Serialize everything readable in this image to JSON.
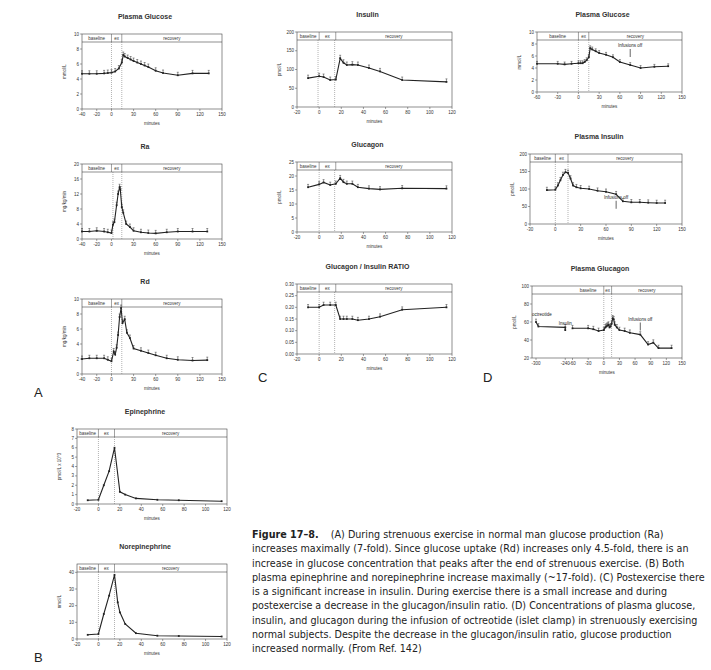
{
  "figure": {
    "caption_label": "Figure 17–8.",
    "caption_text": "(A) During strenuous exercise in normal man glucose production (Ra) increases maximally (7-fold). Since glucose uptake (Rd) increases only 4.5-fold, there is an increase in glucose concentration that peaks after the end of strenuous exercise. (B) Both plasma epinephrine and norepinephrine increase maximally (~17-fold). (C) Postexercise there is a significant increase in insulin. During exercise there is a small increase and during postexercise a decrease in the glucagon/insulin ratio. (D) Concentrations of plasma glucose, insulin, and glucagon during the infusion of octreotide (islet clamp) in strenuously exercising normal subjects. Despite the decrease in the glucagon/insulin ratio, glucose production increased normally. (From Ref. 142)",
    "panel_letters": {
      "A": "A",
      "B": "B",
      "C": "C",
      "D": "D"
    }
  },
  "chart_data": [
    {
      "id": "A1",
      "panel": "A",
      "type": "line",
      "title": "Plasma Glucose",
      "xlabel": "minutes",
      "ylabel": "mmol/L",
      "xlim": [
        -40,
        150
      ],
      "ylim": [
        0,
        10
      ],
      "xticks": [
        -40,
        -20,
        0,
        50,
        60,
        90,
        120,
        150
      ],
      "xtick_labels": [
        "-40",
        "-20",
        "0",
        "30",
        "60",
        "90",
        "120",
        "150"
      ],
      "xticks_pos": [
        -40,
        -20,
        0,
        30,
        60,
        90,
        120,
        150
      ],
      "yticks": [
        0,
        2,
        4,
        6,
        8,
        10
      ],
      "phases": [
        {
          "label": "baseline",
          "x0": -40,
          "x1": 0
        },
        {
          "label": "ex",
          "x0": 0,
          "x1": 14
        },
        {
          "label": "recovery",
          "x0": 14,
          "x1": 150
        }
      ],
      "vlines": [
        0,
        14
      ],
      "x": [
        -40,
        -30,
        -20,
        -10,
        -5,
        0,
        5,
        10,
        14,
        16,
        18,
        22,
        26,
        30,
        35,
        40,
        45,
        50,
        60,
        70,
        90,
        110,
        132
      ],
      "y": [
        4.7,
        4.7,
        4.7,
        4.75,
        4.8,
        4.85,
        5.0,
        5.4,
        6.2,
        7.2,
        7.0,
        6.8,
        6.6,
        6.4,
        6.2,
        6.0,
        5.8,
        5.6,
        5.1,
        4.8,
        4.5,
        4.75,
        4.75
      ],
      "error_bars": true
    },
    {
      "id": "A2",
      "panel": "A",
      "type": "line",
      "title": "Ra",
      "xlabel": "minutes",
      "ylabel": "mg/kg/min",
      "xlim": [
        -40,
        150
      ],
      "ylim": [
        0,
        20
      ],
      "xticks_pos": [
        -40,
        -20,
        0,
        30,
        60,
        90,
        120,
        150
      ],
      "xtick_labels": [
        "-40",
        "-20",
        "0",
        "30",
        "60",
        "90",
        "120",
        "150"
      ],
      "yticks": [
        0,
        4,
        8,
        12,
        16,
        20
      ],
      "phases": [
        {
          "label": "baseline",
          "x0": -40,
          "x1": 0
        },
        {
          "label": "ex",
          "x0": 0,
          "x1": 14
        },
        {
          "label": "recovery",
          "x0": 14,
          "x1": 150
        }
      ],
      "vlines": [
        2,
        14
      ],
      "x": [
        -40,
        -30,
        -20,
        -10,
        -5,
        0,
        2,
        4,
        7,
        9,
        11,
        12,
        14,
        16,
        20,
        25,
        30,
        40,
        50,
        60,
        75,
        90,
        110,
        130
      ],
      "y": [
        2.0,
        2.0,
        2.2,
        2.0,
        1.8,
        1.6,
        3.8,
        4.5,
        9.0,
        12.0,
        13.8,
        13.2,
        8.5,
        7.0,
        4.0,
        3.2,
        2.2,
        1.8,
        1.6,
        1.5,
        1.8,
        2.0,
        2.0,
        2.0
      ],
      "error_bars": true
    },
    {
      "id": "A3",
      "panel": "A",
      "type": "line",
      "title": "Rd",
      "xlabel": "minutes",
      "ylabel": "mg/kg/min",
      "xlim": [
        -40,
        150
      ],
      "ylim": [
        0,
        10
      ],
      "xticks_pos": [
        -40,
        -20,
        0,
        30,
        60,
        90,
        120,
        150
      ],
      "xtick_labels": [
        "-40",
        "-20",
        "0",
        "30",
        "60",
        "90",
        "120",
        "150"
      ],
      "yticks": [
        0,
        2,
        4,
        6,
        8,
        10
      ],
      "phases": [
        {
          "label": "baseline",
          "x0": -40,
          "x1": 0
        },
        {
          "label": "ex",
          "x0": 0,
          "x1": 14
        },
        {
          "label": "recovery",
          "x0": 14,
          "x1": 150
        }
      ],
      "vlines": [
        0,
        14
      ],
      "x": [
        -40,
        -30,
        -20,
        -10,
        -5,
        0,
        3,
        5,
        7,
        9,
        11,
        13,
        15,
        18,
        21,
        25,
        30,
        40,
        50,
        60,
        75,
        90,
        110,
        130
      ],
      "y": [
        2.0,
        2.1,
        2.1,
        2.1,
        1.9,
        1.7,
        3.0,
        2.6,
        3.5,
        5.2,
        7.6,
        8.8,
        6.8,
        7.3,
        5.5,
        4.8,
        3.4,
        3.1,
        2.8,
        2.5,
        2.1,
        1.9,
        1.8,
        1.85
      ],
      "error_bars": true
    },
    {
      "id": "B1",
      "panel": "B",
      "type": "line",
      "title": "Epinephrine",
      "xlabel": "minutes",
      "ylabel": "pmol/L x 10^3",
      "xlim": [
        -20,
        120
      ],
      "ylim": [
        0,
        8
      ],
      "xticks_pos": [
        -20,
        0,
        20,
        40,
        60,
        80,
        100,
        120
      ],
      "xtick_labels": [
        "-20",
        "0",
        "20",
        "40",
        "60",
        "80",
        "100",
        "120"
      ],
      "yticks": [
        0,
        1,
        2,
        3,
        4,
        5,
        6,
        7,
        8
      ],
      "phases": [
        {
          "label": "baseline",
          "x0": -20,
          "x1": 0
        },
        {
          "label": "ex",
          "x0": 0,
          "x1": 15
        },
        {
          "label": "recovery",
          "x0": 15,
          "x1": 120
        }
      ],
      "vlines": [
        0,
        15
      ],
      "x": [
        -10,
        0,
        5,
        10,
        15,
        20,
        25,
        35,
        55,
        75,
        115
      ],
      "y": [
        0.4,
        0.45,
        2.0,
        3.5,
        6.0,
        1.3,
        1.0,
        0.6,
        0.45,
        0.4,
        0.3
      ],
      "error_bars": false
    },
    {
      "id": "B2",
      "panel": "B",
      "type": "line",
      "title": "Norepinephrine",
      "xlabel": "minutes",
      "ylabel": "nmol/L",
      "xlim": [
        -20,
        120
      ],
      "ylim": [
        0,
        45
      ],
      "xticks_pos": [
        -20,
        0,
        20,
        40,
        60,
        80,
        100,
        120
      ],
      "xtick_labels": [
        "-20",
        "0",
        "20",
        "40",
        "60",
        "80",
        "100",
        "120"
      ],
      "yticks": [
        0,
        10,
        20,
        30,
        40
      ],
      "phases": [
        {
          "label": "baseline",
          "x0": -20,
          "x1": 0
        },
        {
          "label": "ex",
          "x0": 0,
          "x1": 15
        },
        {
          "label": "recovery",
          "x0": 15,
          "x1": 120
        }
      ],
      "vlines": [
        0,
        15
      ],
      "x": [
        -10,
        0,
        5,
        10,
        15,
        18,
        20,
        25,
        35,
        55,
        75,
        115
      ],
      "y": [
        2.5,
        3.0,
        15.0,
        26.0,
        38.5,
        22.0,
        16.0,
        9.0,
        3.5,
        2.0,
        1.8,
        1.5
      ],
      "error_bars": false
    },
    {
      "id": "C1",
      "panel": "C",
      "type": "line",
      "title": "Insulin",
      "xlabel": "minutes",
      "ylabel": "pmol/L",
      "xlim": [
        -20,
        120
      ],
      "ylim": [
        0,
        200
      ],
      "xticks_pos": [
        -20,
        0,
        20,
        40,
        60,
        80,
        100,
        120
      ],
      "xtick_labels": [
        "-20",
        "0",
        "20",
        "40",
        "60",
        "80",
        "100",
        "120"
      ],
      "yticks": [
        0,
        50,
        100,
        150,
        200
      ],
      "phases": [
        {
          "label": "baseline",
          "x0": -20,
          "x1": 0
        },
        {
          "label": "ex",
          "x0": 0,
          "x1": 15
        },
        {
          "label": "recovery",
          "x0": 15,
          "x1": 120
        }
      ],
      "vlines": [
        -1,
        14
      ],
      "x": [
        -10,
        0,
        4,
        10,
        15,
        19,
        22,
        25,
        30,
        35,
        45,
        55,
        75,
        115
      ],
      "y": [
        77,
        82,
        80,
        72,
        73,
        130,
        118,
        112,
        113,
        112,
        104,
        95,
        72,
        67
      ],
      "error_bars": true
    },
    {
      "id": "C2",
      "panel": "C",
      "type": "line",
      "title": "Glucagon",
      "xlabel": "minutes",
      "ylabel": "pmol/L",
      "xlim": [
        -20,
        120
      ],
      "ylim": [
        0,
        25
      ],
      "xticks_pos": [
        -20,
        0,
        20,
        40,
        60,
        80,
        100,
        120
      ],
      "xtick_labels": [
        "-20",
        "0",
        "20",
        "40",
        "60",
        "80",
        "100",
        "120"
      ],
      "yticks": [
        0,
        5,
        10,
        15,
        20,
        25
      ],
      "phases": [
        {
          "label": "baseline",
          "x0": -20,
          "x1": 0
        },
        {
          "label": "ex",
          "x0": 0,
          "x1": 15
        },
        {
          "label": "recovery",
          "x0": 15,
          "x1": 120
        }
      ],
      "vlines": [
        0,
        14
      ],
      "x": [
        -10,
        0,
        4,
        10,
        15,
        19,
        22,
        25,
        30,
        35,
        45,
        55,
        75,
        115
      ],
      "y": [
        16,
        17,
        17.7,
        16.8,
        17.2,
        19.2,
        17.8,
        17.2,
        17.2,
        16.0,
        15.5,
        15.2,
        15.6,
        15.5
      ],
      "error_bars": true
    },
    {
      "id": "C3",
      "panel": "C",
      "type": "line",
      "title": "Glucagon / Insulin RATIO",
      "xlabel": "minutes",
      "ylabel": "",
      "xlim": [
        -20,
        120
      ],
      "ylim": [
        0,
        0.3
      ],
      "xticks_pos": [
        -20,
        0,
        20,
        40,
        60,
        80,
        100,
        120
      ],
      "xtick_labels": [
        "-20",
        "0",
        "20",
        "40",
        "60",
        "80",
        "100",
        "120"
      ],
      "yticks": [
        0,
        0.05,
        0.1,
        0.15,
        0.2,
        0.25,
        0.3
      ],
      "ytick_labels": [
        "0.00",
        "0.05",
        "0.10",
        "0.15",
        "0.20",
        "0.25",
        "0.30"
      ],
      "phases": [
        {
          "label": "baseline",
          "x0": -20,
          "x1": 0
        },
        {
          "label": "ex",
          "x0": 0,
          "x1": 15
        },
        {
          "label": "recovery",
          "x0": 15,
          "x1": 120
        }
      ],
      "vlines": [
        0,
        14
      ],
      "x": [
        -10,
        0,
        4,
        10,
        15,
        19,
        22,
        25,
        30,
        35,
        45,
        55,
        75,
        115
      ],
      "y": [
        0.2,
        0.2,
        0.21,
        0.21,
        0.21,
        0.15,
        0.15,
        0.15,
        0.15,
        0.145,
        0.15,
        0.16,
        0.19,
        0.2
      ],
      "error_bars": true
    },
    {
      "id": "D1",
      "panel": "D",
      "type": "line",
      "title": "Plasma Glucose",
      "xlabel": "minutes",
      "ylabel": "mmol/L",
      "xlim": [
        -60,
        150
      ],
      "ylim": [
        0,
        10
      ],
      "xticks_pos": [
        -60,
        -30,
        0,
        30,
        60,
        90,
        120,
        150
      ],
      "xtick_labels": [
        "-60",
        "-30",
        "0",
        "30",
        "60",
        "90",
        "120",
        "150"
      ],
      "yticks": [
        0,
        2,
        4,
        6,
        8,
        10
      ],
      "phases": [
        {
          "label": "baseline",
          "x0": -60,
          "x1": 0
        },
        {
          "label": "ex",
          "x0": 0,
          "x1": 15
        },
        {
          "label": "recovery",
          "x0": 15,
          "x1": 150
        }
      ],
      "vlines": [
        0,
        15
      ],
      "x": [
        -60,
        -30,
        -20,
        -10,
        0,
        3,
        6,
        9,
        12,
        15,
        17,
        20,
        25,
        30,
        40,
        50,
        60,
        75,
        90,
        110,
        130
      ],
      "y": [
        4.7,
        4.7,
        4.6,
        4.7,
        4.8,
        4.8,
        4.8,
        5.0,
        5.3,
        5.8,
        7.3,
        7.1,
        6.8,
        6.5,
        6.2,
        5.8,
        5.0,
        4.5,
        4.0,
        4.2,
        4.3
      ],
      "error_bars": true,
      "annotations": [
        {
          "text": "Infusions off",
          "x": 75,
          "y": 6.5
        }
      ]
    },
    {
      "id": "D2",
      "panel": "D",
      "type": "line",
      "title": "Plasma Insulin",
      "xlabel": "minutes",
      "ylabel": "pmol/L",
      "xlim": [
        -30,
        150
      ],
      "ylim": [
        0,
        200
      ],
      "xticks_pos": [
        -30,
        0,
        30,
        60,
        90,
        120,
        150
      ],
      "xtick_labels": [
        "-30",
        "0",
        "30",
        "60",
        "90",
        "120",
        "150"
      ],
      "yticks": [
        0,
        50,
        100,
        150,
        200
      ],
      "phases": [
        {
          "label": "baseline",
          "x0": -30,
          "x1": 0
        },
        {
          "label": "ex",
          "x0": 0,
          "x1": 15
        },
        {
          "label": "recovery",
          "x0": 15,
          "x1": 150
        }
      ],
      "vlines": [
        0,
        15
      ],
      "x": [
        -10,
        0,
        3,
        6,
        9,
        12,
        15,
        18,
        21,
        25,
        30,
        40,
        50,
        60,
        72,
        80,
        90,
        100,
        110,
        120,
        130
      ],
      "y": [
        97,
        98,
        110,
        125,
        140,
        148,
        146,
        130,
        110,
        105,
        102,
        100,
        95,
        92,
        85,
        65,
        62,
        62,
        61,
        60,
        60
      ],
      "error_bars": true,
      "annotations": [
        {
          "text": "Infusions off",
          "x": 72,
          "y": 55
        }
      ]
    },
    {
      "id": "D3",
      "panel": "D",
      "type": "line",
      "title": "Plasma Glucagon",
      "xlabel": "minutes",
      "ylabel": "pmol/L",
      "xlim": [
        -300,
        150
      ],
      "ylim": [
        20,
        100
      ],
      "xticks_pos": [
        -300,
        -240,
        -60,
        -30,
        0,
        30,
        60,
        90,
        120,
        150
      ],
      "xtick_labels": [
        "-300",
        "-240",
        "-60",
        "-30",
        "0",
        "30",
        "60",
        "90",
        "120",
        "150"
      ],
      "yticks": [
        20,
        40,
        60,
        80,
        100
      ],
      "phases": [
        {
          "label": "baseline",
          "x0": -60,
          "x1": 0
        },
        {
          "label": "ex",
          "x0": 0,
          "x1": 15
        },
        {
          "label": "recovery",
          "x0": 15,
          "x1": 150
        }
      ],
      "vlines": [
        0,
        15
      ],
      "axis_break": true,
      "x": [
        -300,
        -295,
        -240,
        -240
      ],
      "y": [
        60,
        55,
        54,
        51
      ],
      "x2": [
        -60,
        -30,
        -20,
        -10,
        0,
        3,
        5,
        7,
        9,
        11,
        13,
        15,
        17,
        19,
        21,
        25,
        30,
        40,
        50,
        70,
        85,
        95,
        105,
        130
      ],
      "y2": [
        53,
        53,
        52,
        50,
        51,
        54,
        55,
        56,
        57,
        54,
        55,
        58,
        64,
        63,
        57,
        54,
        51,
        50,
        48,
        46,
        35,
        37,
        31,
        31
      ],
      "error_bars": true,
      "annotations": [
        {
          "text": "octreotide",
          "x": -300,
          "y": 60
        },
        {
          "text": "Insulin",
          "x": -240,
          "y": 50
        },
        {
          "text": "Infusions off",
          "x": 70,
          "y": 55
        }
      ]
    }
  ],
  "layout": {
    "panels": [
      {
        "id": "A1",
        "left": 60,
        "top": 10,
        "w": 170,
        "h": 125
      },
      {
        "id": "A2",
        "left": 60,
        "top": 140,
        "w": 170,
        "h": 125
      },
      {
        "id": "A3",
        "left": 60,
        "top": 275,
        "w": 170,
        "h": 125
      },
      {
        "id": "B1",
        "left": 55,
        "top": 405,
        "w": 180,
        "h": 125
      },
      {
        "id": "B2",
        "left": 55,
        "top": 540,
        "w": 180,
        "h": 125
      },
      {
        "id": "C1",
        "left": 275,
        "top": 8,
        "w": 185,
        "h": 125
      },
      {
        "id": "C2",
        "left": 275,
        "top": 138,
        "w": 185,
        "h": 120
      },
      {
        "id": "C3",
        "left": 275,
        "top": 260,
        "w": 185,
        "h": 120
      },
      {
        "id": "D1",
        "left": 515,
        "top": 8,
        "w": 175,
        "h": 110
      },
      {
        "id": "D2",
        "left": 508,
        "top": 130,
        "w": 182,
        "h": 120
      },
      {
        "id": "D3",
        "left": 510,
        "top": 262,
        "w": 180,
        "h": 122
      }
    ]
  }
}
